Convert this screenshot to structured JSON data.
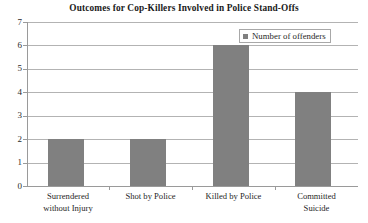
{
  "chart_data": {
    "type": "bar",
    "title": "Outcomes for Cop-Killers Involved in Police Stand-Offs",
    "categories": [
      "Surrendered without Injury",
      "Shot by Police",
      "Killed by Police",
      "Committed Suicide"
    ],
    "category_lines": [
      [
        "Surrendered",
        "without Injury"
      ],
      [
        "Shot by Police"
      ],
      [
        "Killed by Police"
      ],
      [
        "Committed",
        "Suicide"
      ]
    ],
    "values": [
      2,
      2,
      6,
      4
    ],
    "series": [
      {
        "name": "Number of offenders",
        "values": [
          2,
          2,
          6,
          4
        ]
      }
    ],
    "xlabel": "",
    "ylabel": "",
    "ylim": [
      0,
      7
    ],
    "ytick_values": [
      0,
      1,
      2,
      3,
      4,
      5,
      6,
      7
    ],
    "ytick_labels": [
      "0",
      "1",
      "2",
      "3",
      "4",
      "5",
      "6",
      "7"
    ],
    "grid": "horizontal",
    "legend": {
      "position": "top-right",
      "entries": [
        {
          "label": "Number of offenders",
          "color": "#808080",
          "marker": "square"
        }
      ]
    },
    "colors": {
      "bar": "#808080",
      "gridline": "#b3b3b3",
      "axis": "#9a9a9a",
      "text": "#1f1f1f",
      "background": "#ffffff"
    }
  }
}
